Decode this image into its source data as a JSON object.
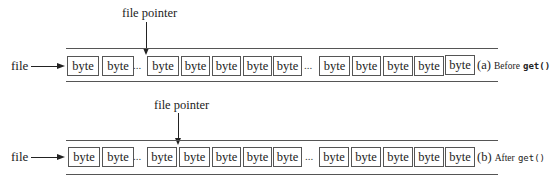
{
  "diagram": {
    "pointer_label": "file pointer",
    "file_label": "file",
    "byte_label": "byte",
    "ellipsis": "...",
    "rows": [
      {
        "id": "a",
        "caption_letter": "(a)",
        "caption_text": "Before",
        "caption_code": "get()",
        "pointer_position": "before third visible byte (after first ellipsis)"
      },
      {
        "id": "b",
        "caption_letter": "(b)",
        "caption_text": "After",
        "caption_code": "get()",
        "pointer_position": "advanced by one byte"
      }
    ]
  }
}
